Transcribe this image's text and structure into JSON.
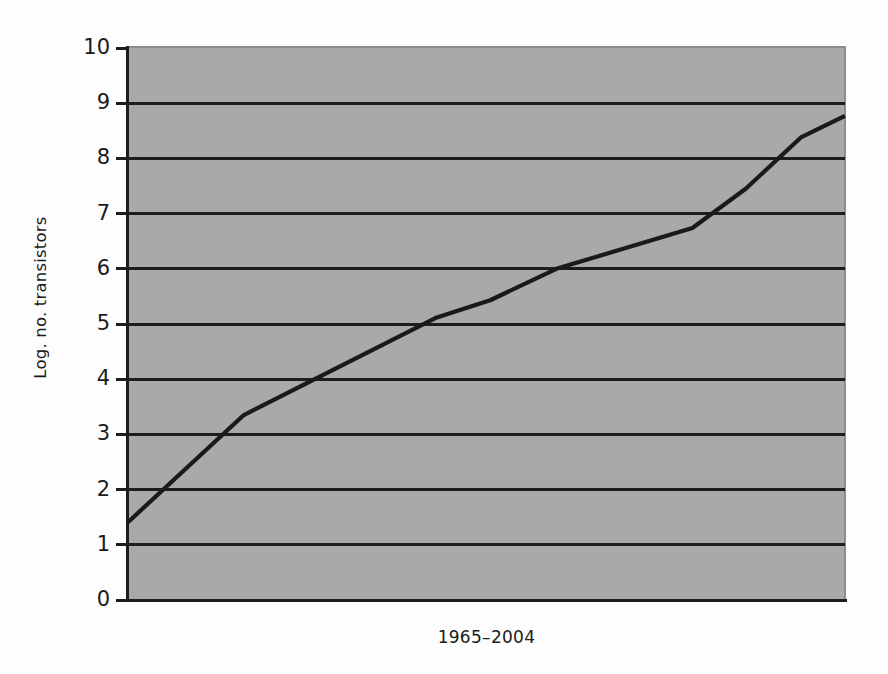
{
  "figure": {
    "background_color": "#fdfdfd",
    "plot_background_color": "#a9a9a9",
    "axis_color": "#1d1d1d",
    "grid_color": "#1d1d1d",
    "series_color": "#1a1a1a"
  },
  "axes": {
    "y_title": "Log. no. transistors",
    "x_title": "1965–2004",
    "y_ticks": [
      "0",
      "1",
      "2",
      "3",
      "4",
      "5",
      "6",
      "7",
      "8",
      "9",
      "10"
    ],
    "x_ticks": []
  },
  "chart_data": {
    "type": "line",
    "title": "",
    "subtitle": "",
    "xlabel": "1965–2004",
    "ylabel": "Log. no. transistors",
    "xlim": [
      1965,
      2004
    ],
    "ylim": [
      0,
      10
    ],
    "ytick_values": [
      0,
      1,
      2,
      3,
      4,
      5,
      6,
      7,
      8,
      9,
      10
    ],
    "xtick_values": [],
    "grid": "horizontal",
    "legend": "none",
    "annotations": [],
    "series": [
      {
        "name": "Log. no. transistors",
        "color": "#1a1a1a",
        "x": [
          1965.0,
          1971.3,
          1981.8,
          1984.7,
          1988.3,
          1995.7,
          1998.6,
          2001.6,
          2004.0
        ],
        "values": [
          1.41,
          3.35,
          5.12,
          5.43,
          6.0,
          6.74,
          7.45,
          8.38,
          8.77
        ]
      }
    ]
  }
}
